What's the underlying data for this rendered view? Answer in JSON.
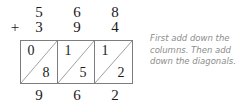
{
  "problem": {
    "operator": "+",
    "addend_top": [
      "5",
      "6",
      "8"
    ],
    "addend_bottom": [
      "3",
      "9",
      "4"
    ],
    "lattice_cells": [
      {
        "upper": "0",
        "lower": "8"
      },
      {
        "upper": "1",
        "lower": "5"
      },
      {
        "upper": "1",
        "lower": "2"
      }
    ],
    "result_digits": [
      "9",
      "6",
      "2"
    ]
  },
  "caption": {
    "line1": "First add down the",
    "line2": "columns. Then add",
    "line3": "down the diagonals."
  },
  "colors": {
    "ink": "#1b1b1b",
    "grid_border": "#7d7d7d",
    "diagonal": "#9a9a9a",
    "caption_text": "#8c8c8c",
    "background": "#ffffff"
  }
}
